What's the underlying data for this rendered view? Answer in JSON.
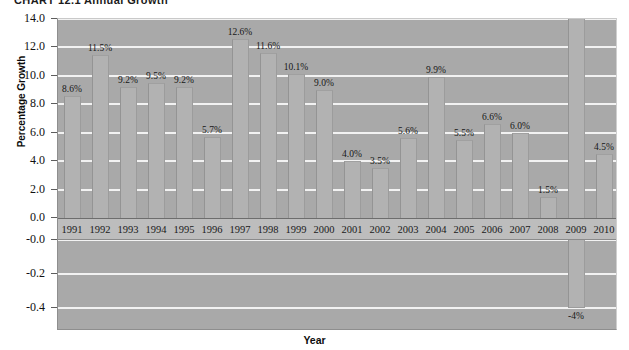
{
  "title": "CHART 12.1   Annual Growth",
  "chart_data": {
    "type": "bar",
    "title": "CHART 12.1   Annual Growth",
    "xlabel": "Year",
    "ylabel": "Percentage Growth",
    "grid": true,
    "legend": "none",
    "categories": [
      "1991",
      "1992",
      "1993",
      "1994",
      "1995",
      "1996",
      "1997",
      "1998",
      "1999",
      "2000",
      "2001",
      "2002",
      "2003",
      "2004",
      "2005",
      "2006",
      "2007",
      "2008",
      "2009",
      "2010"
    ],
    "values": [
      8.6,
      11.5,
      9.2,
      9.5,
      9.2,
      5.7,
      12.6,
      11.6,
      10.1,
      9.0,
      4.0,
      3.5,
      5.6,
      9.9,
      5.5,
      6.6,
      6.0,
      1.5,
      -4.0,
      4.5
    ],
    "data_labels": [
      "8.6%",
      "11.5%",
      "9.2%",
      "9.5%",
      "9.2%",
      "5.7%",
      "12.6%",
      "11.6%",
      "10.1%",
      "9.0%",
      "4.0%",
      "3.5%",
      "5.6%",
      "9.9%",
      "5.5%",
      "6.6%",
      "6.0%",
      "1.5%",
      "-4%",
      "4.5%"
    ],
    "ylim": [
      0,
      14
    ],
    "yticks_upper": [
      "14.0",
      "12.0",
      "10.0",
      "8.0",
      "6.0",
      "4.0",
      "2.0",
      "0.0"
    ],
    "yticks_upper_values": [
      14.0,
      12.0,
      10.0,
      8.0,
      6.0,
      4.0,
      2.0,
      0.0
    ],
    "yticks_lower": [
      "-0.0",
      "-0.2",
      "-0.4"
    ],
    "yticks_lower_values": [
      -0.0,
      -0.2,
      -0.4
    ],
    "bar_color": "#b2b2b2",
    "plot_background": "#a9a9a9",
    "gridline_color": "#f2f2f2"
  }
}
